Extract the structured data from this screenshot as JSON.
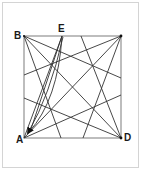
{
  "diagram": {
    "type": "geometric-construction",
    "labels": {
      "B": "B",
      "E": "E",
      "A": "A",
      "D": "D"
    },
    "colors": {
      "square_border": "#9a9a9a",
      "lines": "#333333",
      "labels": "#1a1a1a",
      "frame": "#d4d4d4"
    },
    "points": {
      "B": [
        24,
        36
      ],
      "C": [
        121,
        36
      ],
      "A": [
        24,
        138
      ],
      "D": [
        121,
        138
      ],
      "E": [
        62,
        36
      ]
    }
  }
}
